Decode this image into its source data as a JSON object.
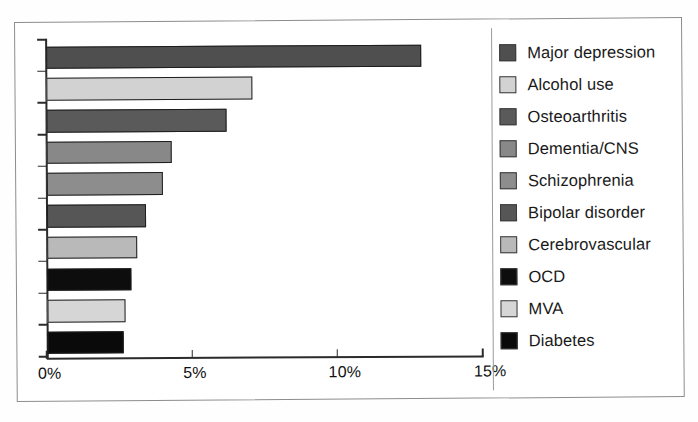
{
  "figure": {
    "frame_visible": true,
    "background_color": "#ffffff",
    "axis_color": "#2b2b2b",
    "frame_color": "#8d8d8d",
    "legend_divider_color": "#9a9a9a"
  },
  "chart_data": {
    "type": "bar",
    "orientation": "horizontal",
    "title": "",
    "subtitle": "",
    "xlabel": "",
    "ylabel": "",
    "xlim": [
      0,
      15
    ],
    "ylim": null,
    "grid": false,
    "legend_position": "right",
    "x_tick_labels": [
      "0%",
      "5%",
      "10%",
      "15%"
    ],
    "x_tick_values": [
      0,
      5,
      10,
      15
    ],
    "categories": [
      "Major depression",
      "Alcohol use",
      "Osteoarthritis",
      "Dementia/CNS",
      "Schizophrenia",
      "Bipolar disorder",
      "Cerebrovascular",
      "OCD",
      "MVA",
      "Diabetes"
    ],
    "values": [
      12.9,
      7.1,
      6.2,
      4.3,
      4.0,
      3.4,
      3.1,
      2.9,
      2.7,
      2.6
    ],
    "value_unit": "%",
    "colors": [
      "#4f4f4f",
      "#d2d2d2",
      "#5a5a5a",
      "#888888",
      "#8d8d8d",
      "#565656",
      "#b9b9b9",
      "#0d0d0d",
      "#d6d6d6",
      "#0a0a0a"
    ],
    "legend": [
      {
        "label": "Major depression",
        "color": "#4f4f4f"
      },
      {
        "label": "Alcohol use",
        "color": "#d2d2d2"
      },
      {
        "label": "Osteoarthritis",
        "color": "#5a5a5a"
      },
      {
        "label": "Dementia/CNS",
        "color": "#888888"
      },
      {
        "label": "Schizophrenia",
        "color": "#8d8d8d"
      },
      {
        "label": "Bipolar disorder",
        "color": "#565656"
      },
      {
        "label": "Cerebrovascular",
        "color": "#b9b9b9"
      },
      {
        "label": "OCD",
        "color": "#0d0d0d"
      },
      {
        "label": "MVA",
        "color": "#d6d6d6"
      },
      {
        "label": "Diabetes",
        "color": "#0a0a0a"
      }
    ]
  }
}
